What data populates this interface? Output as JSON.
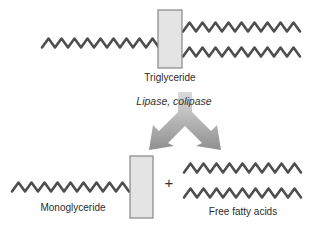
{
  "diagram": {
    "labels": {
      "substrate": "Triglyceride",
      "enzymes": "Lipase, colipase",
      "product_left": "Monoglyceride",
      "operator": "+",
      "product_right": "Free fatty acids"
    },
    "colors": {
      "background": "#ffffff",
      "chain_stroke": "#4e4e4e",
      "backbone_fill": "#e4e4e4",
      "backbone_border": "#878787",
      "arrow_gradient_top": "#dedede",
      "arrow_gradient_bottom": "#8d8d8d",
      "label_text": "#2b2b2b"
    }
  }
}
